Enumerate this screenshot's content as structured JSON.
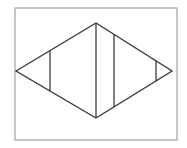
{
  "canvas": {
    "width": 187,
    "height": 148,
    "background_color": "#ffffff"
  },
  "frame": {
    "name": "image-border-frame",
    "x": 15,
    "y": 8,
    "width": 162,
    "height": 132,
    "stroke_color": "#b0b0b0",
    "stroke_width": 1.4,
    "fill_color": "#ffffff"
  },
  "figure": {
    "shape_type": "rhombus",
    "stroke_color": "#3c3c3c",
    "stroke_width": 1.4,
    "fill_color": "#ffffff",
    "vertices": [
      {
        "label": "left",
        "x": 16,
        "y": 71
      },
      {
        "label": "top",
        "x": 96,
        "y": 23
      },
      {
        "label": "right",
        "x": 172,
        "y": 71
      },
      {
        "label": "bottom",
        "x": 96,
        "y": 118
      }
    ],
    "polygon_points": "16,71 96,23 172,71 96,118",
    "chords": [
      {
        "label": "chord-1",
        "x": 50,
        "y1": 51,
        "y2": 91,
        "stroke_color": "#3c3c3c",
        "stroke_width": 1.3
      },
      {
        "label": "chord-2",
        "x": 96,
        "y1": 23,
        "y2": 118,
        "stroke_color": "#3c3c3c",
        "stroke_width": 1.3
      },
      {
        "label": "chord-3",
        "x": 114,
        "y1": 34,
        "y2": 107,
        "stroke_color": "#3c3c3c",
        "stroke_width": 1.3
      },
      {
        "label": "chord-4",
        "x": 156,
        "y1": 61,
        "y2": 81,
        "stroke_color": "#3c3c3c",
        "stroke_width": 1.3
      }
    ],
    "region_count": 5
  }
}
